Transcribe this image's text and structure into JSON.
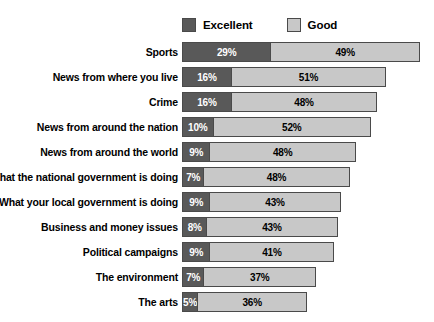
{
  "legend": {
    "entries": [
      {
        "label": "Excellent",
        "color": "#595959",
        "icon": "legend-swatch-icon"
      },
      {
        "label": "Good",
        "color": "#c8c8c8",
        "icon": "legend-swatch-icon"
      }
    ]
  },
  "chart_data": {
    "type": "bar",
    "subtype": "stacked-horizontal",
    "title": "",
    "xlabel": "",
    "ylabel": "",
    "xlim": [
      0,
      78
    ],
    "grid": false,
    "legend_position": "top",
    "value_suffix": "%",
    "categories": [
      "Sports",
      "News from where you live",
      "Crime",
      "News from around the nation",
      "News from around the world",
      "What the national government is doing",
      "What your local government is doing",
      "Business and money issues",
      "Political campaigns",
      "The environment",
      "The arts"
    ],
    "series": [
      {
        "name": "Excellent",
        "color": "#595959",
        "values": [
          29,
          16,
          16,
          10,
          9,
          7,
          9,
          8,
          9,
          7,
          5
        ],
        "labels": [
          "29%",
          "16%",
          "16%",
          "10%",
          "9%",
          "7%",
          "9%",
          "8%",
          "9%",
          "7%",
          "5%"
        ]
      },
      {
        "name": "Good",
        "color": "#c8c8c8",
        "values": [
          49,
          51,
          48,
          52,
          48,
          48,
          43,
          43,
          41,
          37,
          36
        ],
        "labels": [
          "49%",
          "51%",
          "48%",
          "52%",
          "48%",
          "48%",
          "43%",
          "43%",
          "41%",
          "37%",
          "36%"
        ]
      }
    ],
    "totals": [
      78,
      67,
      64,
      62,
      57,
      55,
      52,
      51,
      50,
      44,
      41
    ]
  },
  "scale": {
    "px_per_percent": 3.05
  }
}
